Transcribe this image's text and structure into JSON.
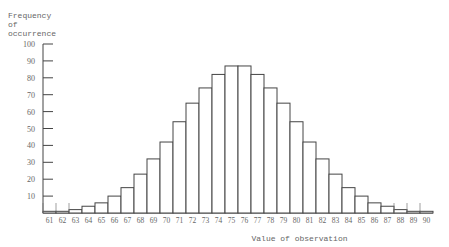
{
  "chart_data": {
    "type": "bar",
    "title": "",
    "xlabel": "Value of observation",
    "ylabel": "Frequency of occurrence",
    "ylim": [
      0,
      100
    ],
    "yticks": [
      10,
      20,
      30,
      40,
      50,
      60,
      70,
      80,
      90,
      100
    ],
    "grid": false,
    "categories": [
      "61",
      "62",
      "63",
      "64",
      "65",
      "66",
      "67",
      "68",
      "69",
      "70",
      "71",
      "72",
      "73",
      "74",
      "75",
      "76",
      "77",
      "78",
      "79",
      "80",
      "81",
      "82",
      "83",
      "84",
      "85",
      "86",
      "87",
      "88",
      "89",
      "90"
    ],
    "values": [
      1,
      1,
      2,
      4,
      6,
      10,
      15,
      23,
      32,
      42,
      54,
      65,
      74,
      82,
      87,
      87,
      82,
      74,
      65,
      54,
      42,
      32,
      23,
      15,
      10,
      6,
      4,
      2,
      1,
      1
    ]
  },
  "labels": {
    "ylabel_lines": "Frequency\nof\noccurrence",
    "xlabel": "Value of observation"
  }
}
